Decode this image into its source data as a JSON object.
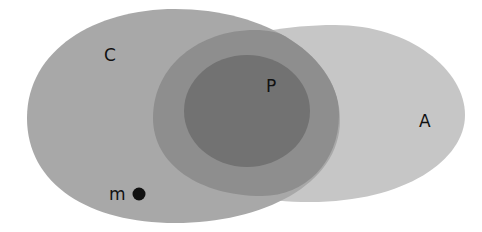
{
  "diagram": {
    "type": "euler-diagram",
    "sets": {
      "C": {
        "label": "C",
        "fill": "#a8a8a8"
      },
      "A": {
        "label": "A",
        "fill": "#c6c6c6"
      },
      "overlap": {
        "label": "",
        "fill": "#8e8e8e"
      },
      "P": {
        "label": "P",
        "fill": "#727272"
      }
    },
    "point": {
      "label": "m",
      "color": "#111111"
    }
  }
}
